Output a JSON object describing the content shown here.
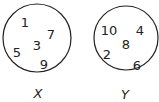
{
  "sets": [
    {
      "name": "X",
      "circle": {
        "cx": 37,
        "cy": 38,
        "r": 34
      },
      "label_pos": {
        "x": 38,
        "y": 98
      },
      "elements": [
        {
          "value": "1",
          "x": 25,
          "y": 27
        },
        {
          "value": "7",
          "x": 51,
          "y": 39
        },
        {
          "value": "3",
          "x": 37,
          "y": 50
        },
        {
          "value": "5",
          "x": 17,
          "y": 57
        },
        {
          "value": "9",
          "x": 44,
          "y": 69
        }
      ]
    },
    {
      "name": "Y",
      "circle": {
        "cx": 126,
        "cy": 38,
        "r": 32
      },
      "label_pos": {
        "x": 125,
        "y": 99
      },
      "elements": [
        {
          "value": "10",
          "x": 109,
          "y": 35
        },
        {
          "value": "4",
          "x": 140,
          "y": 35
        },
        {
          "value": "8",
          "x": 126,
          "y": 49
        },
        {
          "value": "2",
          "x": 107,
          "y": 59
        },
        {
          "value": "6",
          "x": 137,
          "y": 70
        }
      ]
    }
  ],
  "colors": {
    "stroke": "#222222",
    "text": "#222222",
    "background": "#ffffff"
  }
}
